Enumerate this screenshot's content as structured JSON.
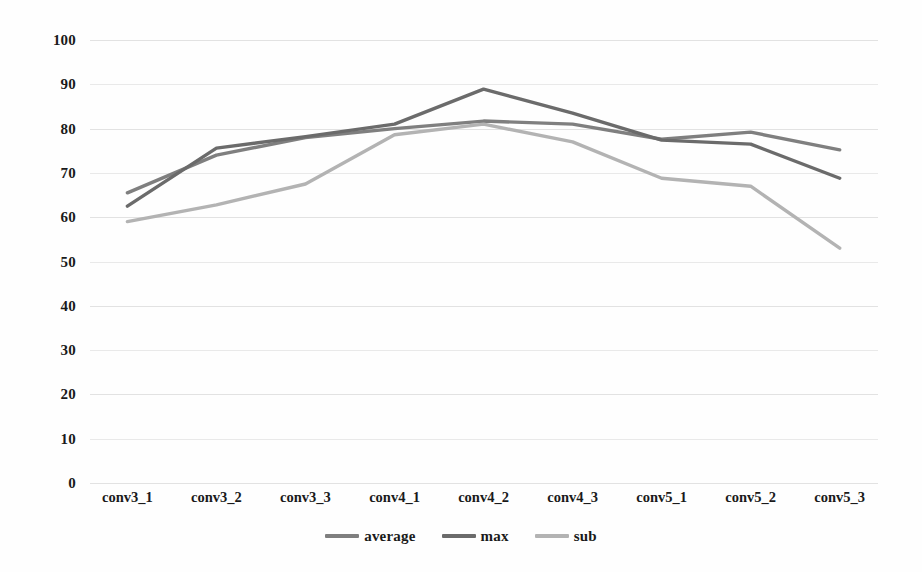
{
  "chart_data": {
    "type": "line",
    "title": "",
    "subtitle": "",
    "xlabel": "",
    "ylabel": "",
    "categories": [
      "conv3_1",
      "conv3_2",
      "conv3_3",
      "conv4_1",
      "conv4_2",
      "conv4_3",
      "conv5_1",
      "conv5_2",
      "conv5_3"
    ],
    "series": [
      {
        "name": "average",
        "color": "#7f7f7f",
        "values": [
          65.5,
          74.0,
          78.0,
          80.0,
          81.7,
          81.0,
          77.6,
          79.2,
          75.2
        ]
      },
      {
        "name": "max",
        "color": "#6b6b6b",
        "values": [
          62.5,
          75.6,
          78.2,
          81.0,
          88.9,
          83.5,
          77.4,
          76.5,
          68.8
        ]
      },
      {
        "name": "sub",
        "color": "#b3b3b3",
        "values": [
          59.0,
          62.8,
          67.5,
          78.6,
          81.0,
          77.0,
          68.8,
          67.0,
          53.0
        ]
      }
    ],
    "ylim": [
      0,
      100
    ],
    "ytick_values": [
      0,
      10,
      20,
      30,
      40,
      50,
      60,
      70,
      80,
      90,
      100
    ],
    "ytick_labels": [
      "0",
      "10",
      "20",
      "30",
      "40",
      "50",
      "60",
      "70",
      "80",
      "90",
      "100"
    ],
    "grid": true,
    "grid_color": "#d8d8d8",
    "legend_position": "bottom",
    "legend": [
      "average",
      "max",
      "sub"
    ],
    "background_color": "#ffffff"
  }
}
